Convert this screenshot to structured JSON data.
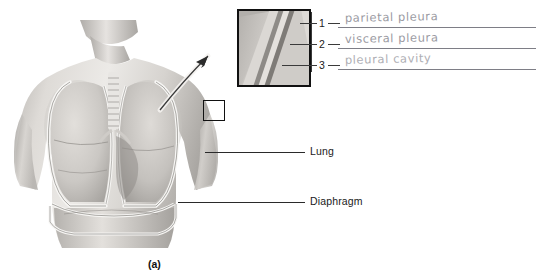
{
  "figure": {
    "caption": "(a)",
    "printed_labels": [
      {
        "name": "lung",
        "text": "Lung"
      },
      {
        "name": "diaphragm",
        "text": "Diaphragm"
      }
    ],
    "inset": {
      "name": "pleura-magnified-detail",
      "numbers": [
        "1",
        "2",
        "3"
      ]
    },
    "answers": [
      {
        "number": "1",
        "text": "parietal pleura"
      },
      {
        "number": "2",
        "text": "visceral pleura"
      },
      {
        "number": "3",
        "text": "pleural cavity"
      }
    ]
  },
  "colors": {
    "ink_handwriting": "#9a9aa2",
    "rule_line": "#7e7e86",
    "printed_text": "#1a1a1a",
    "box_outline": "#111111",
    "skin_light": "#e9e7e4",
    "skin_mid": "#c9c6c2",
    "skin_dark": "#9b9894",
    "pleura_white": "#f6f5f3"
  }
}
